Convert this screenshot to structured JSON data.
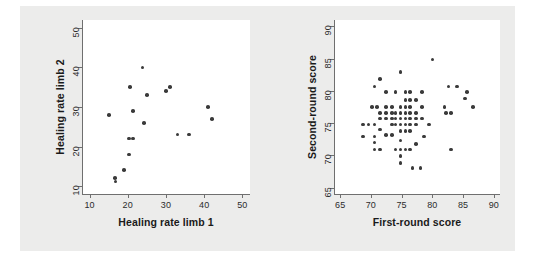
{
  "figure": {
    "background_color": "#ececeb",
    "plot_background_color": "#ffffff",
    "marker_color": "#3a3a3a",
    "axis_color": "#6f6f6f"
  },
  "chart_data": [
    {
      "type": "scatter",
      "panel": "left",
      "title": "",
      "xlabel": "Healing rate limb 1",
      "ylabel": "Healing rate limb 2",
      "xlim": [
        8,
        52
      ],
      "ylim": [
        8,
        52
      ],
      "xticks": [
        10,
        20,
        30,
        40,
        50
      ],
      "yticks": [
        10,
        20,
        30,
        40,
        50
      ],
      "xticklabels": [
        "10",
        "20",
        "30",
        "40",
        "50"
      ],
      "yticklabels": [
        "10",
        "20",
        "30",
        "40",
        "50"
      ],
      "grid": false,
      "legend": null,
      "points": [
        [
          15,
          28
        ],
        [
          16.6,
          12
        ],
        [
          16.8,
          11.2
        ],
        [
          19,
          14
        ],
        [
          20.3,
          18
        ],
        [
          20.3,
          22
        ],
        [
          21.3,
          22
        ],
        [
          20.6,
          35
        ],
        [
          21.3,
          29
        ],
        [
          23.8,
          40
        ],
        [
          24.2,
          26
        ],
        [
          25,
          33
        ],
        [
          30,
          34
        ],
        [
          31,
          35
        ],
        [
          33,
          23
        ],
        [
          36,
          23
        ],
        [
          41,
          30
        ],
        [
          42,
          27
        ]
      ]
    },
    {
      "type": "scatter",
      "panel": "right",
      "title": "",
      "xlabel": "First-round score",
      "ylabel": "Second-round score",
      "xlim": [
        64,
        91
      ],
      "ylim": [
        64,
        91
      ],
      "xticks": [
        65,
        70,
        75,
        80,
        85,
        90
      ],
      "yticks": [
        65,
        70,
        75,
        80,
        85,
        90
      ],
      "xticklabels": [
        "65",
        "70",
        "75",
        "80",
        "85",
        "90"
      ],
      "yticklabels": [
        "65",
        "70",
        "75",
        "80",
        "85",
        "90"
      ],
      "grid": false,
      "legend": null,
      "points": [
        [
          68.7,
          74.8
        ],
        [
          68.7,
          72.9
        ],
        [
          69.6,
          74.8
        ],
        [
          70.2,
          77.5
        ],
        [
          70.6,
          80.7
        ],
        [
          70.6,
          74.8
        ],
        [
          70.6,
          72.9
        ],
        [
          70.6,
          72.0
        ],
        [
          70.6,
          70.9
        ],
        [
          71.0,
          77.5
        ],
        [
          71.5,
          81.8
        ],
        [
          71.5,
          76.6
        ],
        [
          71.5,
          75.7
        ],
        [
          71.5,
          74.0
        ],
        [
          71.5,
          70.9
        ],
        [
          72.5,
          79.8
        ],
        [
          72.5,
          77.5
        ],
        [
          72.5,
          76.6
        ],
        [
          72.5,
          75.7
        ],
        [
          72.5,
          73.2
        ],
        [
          73.4,
          77.5
        ],
        [
          73.4,
          76.6
        ],
        [
          73.4,
          75.7
        ],
        [
          73.4,
          74.8
        ],
        [
          73.4,
          73.2
        ],
        [
          74.0,
          79.8
        ],
        [
          74.0,
          76.6
        ],
        [
          74.0,
          75.7
        ],
        [
          74.0,
          74.8
        ],
        [
          74.0,
          70.9
        ],
        [
          74.8,
          82.9
        ],
        [
          74.8,
          77.5
        ],
        [
          74.8,
          76.6
        ],
        [
          74.8,
          75.7
        ],
        [
          74.8,
          74.8
        ],
        [
          74.8,
          73.8
        ],
        [
          74.8,
          72.3
        ],
        [
          74.8,
          70.9
        ],
        [
          74.8,
          69.9
        ],
        [
          74.8,
          68.8
        ],
        [
          75.6,
          79.8
        ],
        [
          75.6,
          78.6
        ],
        [
          75.6,
          77.5
        ],
        [
          75.6,
          76.6
        ],
        [
          75.6,
          75.7
        ],
        [
          75.6,
          74.8
        ],
        [
          75.6,
          73.8
        ],
        [
          75.6,
          70.9
        ],
        [
          76.4,
          79.8
        ],
        [
          76.4,
          78.6
        ],
        [
          76.4,
          77.5
        ],
        [
          76.4,
          76.6
        ],
        [
          76.4,
          75.7
        ],
        [
          76.4,
          74.8
        ],
        [
          76.4,
          73.8
        ],
        [
          76.4,
          70.9
        ],
        [
          76.8,
          68.0
        ],
        [
          77.3,
          78.6
        ],
        [
          77.3,
          76.6
        ],
        [
          77.3,
          75.7
        ],
        [
          77.3,
          74.8
        ],
        [
          77.3,
          71.8
        ],
        [
          78.1,
          68.0
        ],
        [
          78.3,
          79.8
        ],
        [
          78.3,
          77.5
        ],
        [
          78.3,
          75.7
        ],
        [
          78.6,
          72.9
        ],
        [
          79.5,
          74.8
        ],
        [
          80.0,
          84.9
        ],
        [
          82.0,
          77.5
        ],
        [
          82.2,
          76.6
        ],
        [
          82.6,
          80.7
        ],
        [
          83.0,
          76.6
        ],
        [
          83.0,
          70.9
        ],
        [
          84.0,
          80.7
        ],
        [
          85.3,
          78.8
        ],
        [
          85.6,
          79.8
        ],
        [
          86.6,
          77.5
        ]
      ]
    }
  ]
}
